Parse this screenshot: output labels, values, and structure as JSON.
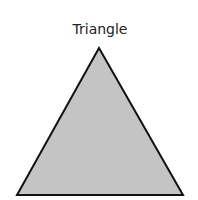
{
  "diagram": {
    "title": "Triangle",
    "shape": {
      "type": "triangle",
      "points": [
        [
          99,
          48
        ],
        [
          17,
          195
        ],
        [
          183,
          195
        ]
      ],
      "fill": "#c4c4c4",
      "stroke": "#111111",
      "stroke_width": 2
    }
  }
}
